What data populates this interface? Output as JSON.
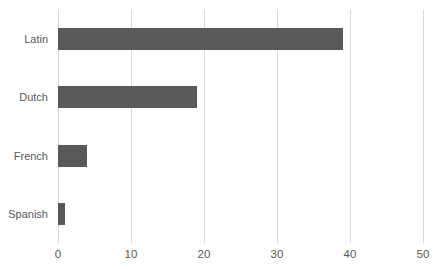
{
  "chart_data": {
    "type": "bar",
    "orientation": "horizontal",
    "title": "",
    "xlabel": "",
    "ylabel": "",
    "categories": [
      "Latin",
      "Dutch",
      "French",
      "Spanish"
    ],
    "values": [
      39,
      19,
      4,
      1
    ],
    "xlim": [
      0,
      50
    ],
    "xticks": [
      "0",
      "10",
      "20",
      "30",
      "40",
      "50"
    ],
    "xtick_values": [
      0,
      10,
      20,
      30,
      40,
      50
    ],
    "grid": "vertical-only",
    "legend": "none",
    "bar_color": "#595959",
    "gridline_color": "#d9d9d9",
    "text_color": "#595959",
    "background_color": "#ffffff"
  },
  "caption": {
    "clipped_text": ""
  }
}
